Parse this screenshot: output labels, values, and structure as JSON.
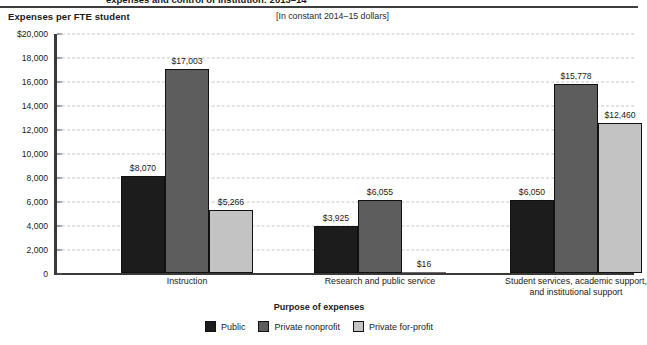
{
  "figure": {
    "clipped_title": "expenses and control of institution: 2013–14",
    "axis_unit_label": "Expenses per FTE student",
    "constant_dollars_note": "[In constant 2014–15 dollars]"
  },
  "legend": {
    "items": [
      {
        "label": "Public",
        "color": "#1c1c1c"
      },
      {
        "label": "Private nonprofit",
        "color": "#5d5d5d"
      },
      {
        "label": "Private for-profit",
        "color": "#c3c3c3"
      }
    ]
  },
  "chart_data": {
    "type": "bar",
    "title": "expenses and control of institution: 2013–14",
    "subtitle": "[In constant 2014–15 dollars]",
    "xlabel": "Purpose of expenses",
    "ylabel": "Expenses per FTE student",
    "ylim": [
      0,
      20000
    ],
    "ytick_values": [
      0,
      2000,
      4000,
      6000,
      8000,
      10000,
      12000,
      14000,
      16000,
      18000,
      20000
    ],
    "ytick_labels": [
      "0",
      "2,000",
      "4,000",
      "6,000",
      "8,000",
      "10,000",
      "12,000",
      "14,000",
      "16,000",
      "18,000",
      "$20,000"
    ],
    "grid": true,
    "legend_position": "bottom",
    "categories": [
      "Instruction",
      "Research and public service",
      "Student services, academic support, and institutional support"
    ],
    "category_lines": [
      [
        "Instruction"
      ],
      [
        "Research and public service"
      ],
      [
        "Student services, academic support,",
        "and institutional support"
      ]
    ],
    "series": [
      {
        "name": "Public",
        "color": "#1c1c1c",
        "values": [
          8070,
          3925,
          6050
        ],
        "labels": [
          "$8,070",
          "$3,925",
          "$6,050"
        ]
      },
      {
        "name": "Private nonprofit",
        "color": "#5d5d5d",
        "values": [
          17003,
          6055,
          15778
        ],
        "labels": [
          "$17,003",
          "$6,055",
          "$15,778"
        ]
      },
      {
        "name": "Private for-profit",
        "color": "#c3c3c3",
        "values": [
          5266,
          16,
          12460
        ],
        "labels": [
          "$5,266",
          "$16",
          "$12,460"
        ]
      }
    ]
  }
}
